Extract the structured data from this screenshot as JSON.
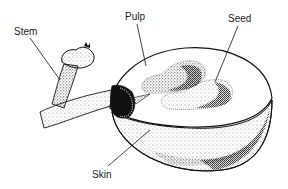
{
  "diagram": {
    "labels": [
      {
        "id": "stem",
        "text": "Stem"
      },
      {
        "id": "pulp",
        "text": "Pulp"
      },
      {
        "id": "seed",
        "text": "Seed"
      },
      {
        "id": "skin",
        "text": "Skin"
      }
    ],
    "colors": {
      "ink": "#111111",
      "background": "#ffffff"
    }
  }
}
